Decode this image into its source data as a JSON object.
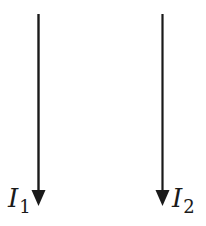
{
  "diagram": {
    "stroke_color": "#1a1a1a",
    "wires": [
      {
        "id": "wire-1",
        "x": 38.5,
        "y_top": 14,
        "y_tip": 206,
        "direction": "down",
        "label_symbol": "I",
        "label_subscript": "1"
      },
      {
        "id": "wire-2",
        "x": 162.5,
        "y_top": 14,
        "y_tip": 206,
        "direction": "down",
        "label_symbol": "I",
        "label_subscript": "2"
      }
    ]
  }
}
